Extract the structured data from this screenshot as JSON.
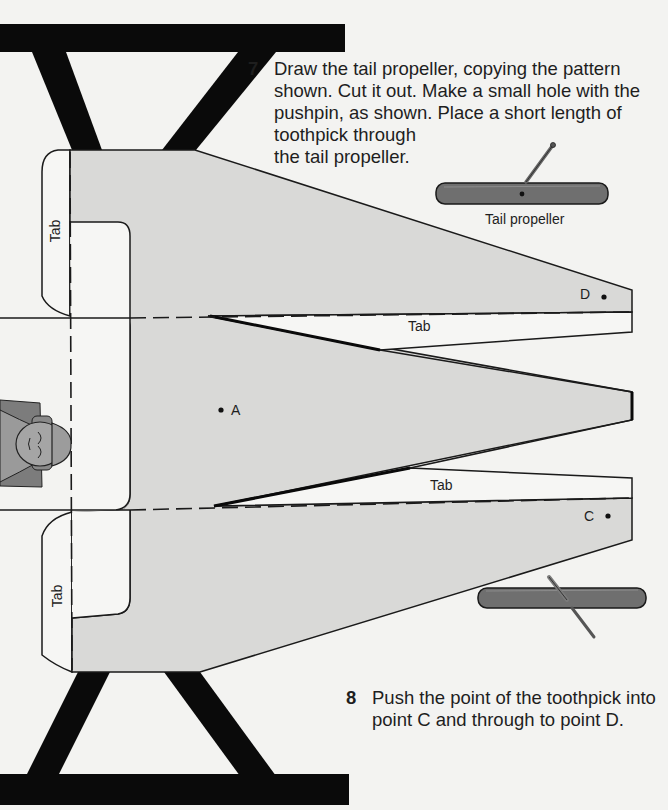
{
  "steps": [
    {
      "number": "7",
      "lines": [
        "Draw the tail propeller, copying the pattern",
        "shown. Cut it out. Make a small hole with the",
        "pushpin, as shown. Place a short length of",
        "toothpick through",
        "the tail propeller."
      ]
    },
    {
      "number": "8",
      "lines": [
        "Push the point of the toothpick into",
        "point C and through to point D."
      ]
    }
  ],
  "labels": {
    "tail_propeller": "Tail propeller",
    "tab_left_top": "Tab",
    "tab_left_bottom": "Tab",
    "tab_right_top": "Tab",
    "tab_right_bottom": "Tab",
    "point_a": "A",
    "point_c": "C",
    "point_d": "D"
  },
  "colors": {
    "paper": "#f3f3f1",
    "pattern_fill": "#d9d9d7",
    "frame": "#0a0a0a",
    "propeller": "#6f6f6f",
    "line": "#1a1a1a"
  }
}
